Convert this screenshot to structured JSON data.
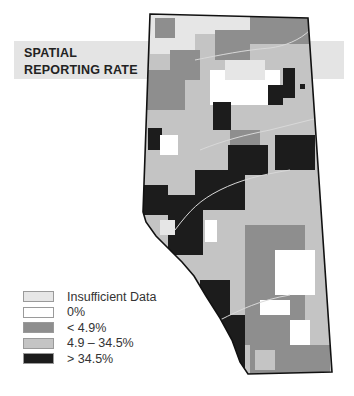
{
  "title": {
    "line1": "SPATIAL",
    "line2": "REPORTING RATE"
  },
  "legend": {
    "items": [
      {
        "label": "Insufficient Data",
        "color": "#e6e6e6"
      },
      {
        "label": "0%",
        "color": "#ffffff"
      },
      {
        "label": "< 4.9%",
        "color": "#8e8e8e"
      },
      {
        "label": "4.9 – 34.5%",
        "color": "#c4c4c4"
      },
      {
        "label": "> 34.5%",
        "color": "#1c1c1c"
      }
    ]
  },
  "colors": {
    "banner": "#e4e4e4",
    "border": "#111111",
    "river": "#d8d8d8"
  }
}
